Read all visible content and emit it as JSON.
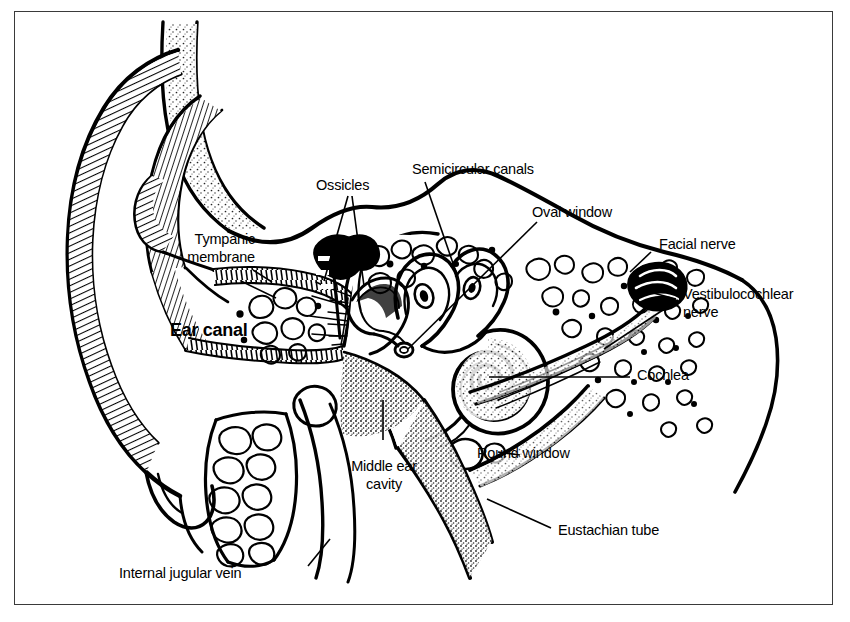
{
  "figure": {
    "kind": "anatomical-line-diagram",
    "border_color": "#3a3a3a",
    "ink_color": "#000000",
    "background_color": "#ffffff"
  },
  "labels": {
    "ear_canal": "Ear canal",
    "tympanic_membrane_line1": "Tympanic",
    "tympanic_membrane_line2": "membrane",
    "ossicles": "Ossicles",
    "semicircular_canals": "Semicircular canals",
    "oval_window": "Oval window",
    "facial_nerve": "Facial nerve",
    "vestibulocochlear_nerve_line1": "Vestibulocochlear",
    "vestibulocochlear_nerve_line2": "nerve",
    "cochlea": "Cochlea",
    "round_window": "Round window",
    "middle_ear_cavity_line1": "Middle ear",
    "middle_ear_cavity_line2": "cavity",
    "eustachian_tube": "Eustachian tube",
    "internal_jugular_vein": "Internal jugular vein"
  }
}
